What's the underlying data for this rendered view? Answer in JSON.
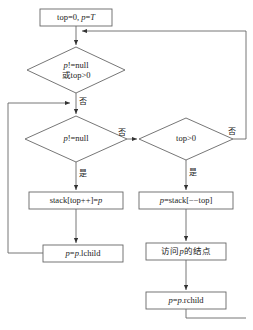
{
  "diagram": {
    "type": "flowchart",
    "stroke_color": "#555555",
    "text_color": "#1a1a1a",
    "background": "#ffffff",
    "nodes": [
      {
        "id": "init",
        "shape": "process",
        "text": "top=0, p=T"
      },
      {
        "id": "cond_main",
        "shape": "decision",
        "line1": "p!=null",
        "line2": "或top>0"
      },
      {
        "id": "cond_pnull",
        "shape": "decision",
        "text": "p!=null"
      },
      {
        "id": "cond_top",
        "shape": "decision",
        "text": "top>0"
      },
      {
        "id": "push",
        "shape": "process",
        "text": "stack[top++]=p"
      },
      {
        "id": "pop",
        "shape": "process",
        "text": "p=stack[−−top]"
      },
      {
        "id": "go_left",
        "shape": "process",
        "text": "p=p.lchild"
      },
      {
        "id": "visit",
        "shape": "process",
        "text": "访问p的结点"
      },
      {
        "id": "go_right",
        "shape": "process",
        "text": "p=p.rchild"
      }
    ],
    "edge_labels": {
      "main_no": "否",
      "pnull_yes": "是",
      "pnull_no": "否",
      "top_yes": "是",
      "top_no": "否"
    }
  }
}
